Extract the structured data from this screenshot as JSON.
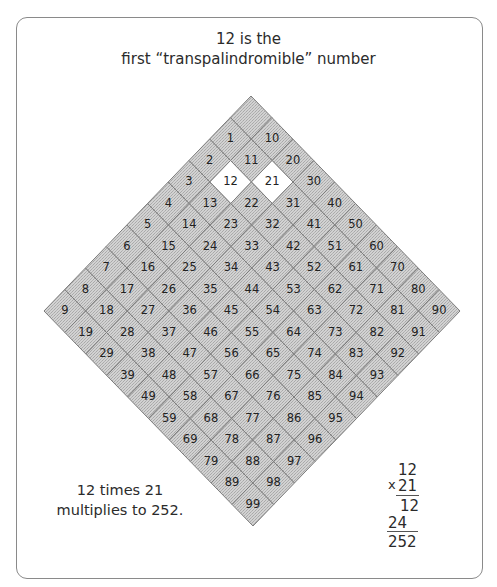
{
  "title": {
    "line1": "12 is the",
    "line2": "first “transpalindromible” number"
  },
  "grid": {
    "description": "10x10 grid of numbers 0-99 rotated 45 degrees; value = 10*a + b",
    "highlighted": [
      "12",
      "21"
    ],
    "top_cell_label": "",
    "fill_color": "#c9c9c9",
    "highlight_color": "#ffffff",
    "border_color": "#7d7d7d",
    "rows": [
      [
        "",
        "1",
        "10"
      ],
      [
        "2",
        "11",
        "20"
      ],
      [
        "3",
        "12",
        "21",
        "30"
      ],
      [
        "4",
        "13",
        "22",
        "31",
        "40"
      ]
    ]
  },
  "caption": {
    "line1": "12 times 21",
    "line2": "multiplies to 252."
  },
  "multiplication": {
    "multiplicand": "12",
    "operator": "x",
    "multiplier": "21",
    "partial1": "12",
    "partial2": "24",
    "result": "252"
  }
}
